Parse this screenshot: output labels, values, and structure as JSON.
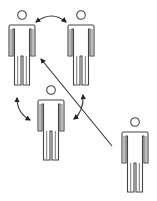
{
  "diagram": {
    "title": "",
    "colors": {
      "stroke": "#444444",
      "arrow": "#222222",
      "background": "#ffffff"
    },
    "figures": [
      {
        "id": "person-top-left",
        "cx": 22,
        "top": 10,
        "icon": "person-icon"
      },
      {
        "id": "person-top-right",
        "cx": 81,
        "top": 10,
        "icon": "person-icon"
      },
      {
        "id": "person-middle",
        "cx": 51,
        "top": 85,
        "icon": "person-icon"
      },
      {
        "id": "person-outsider",
        "cx": 135,
        "top": 117,
        "icon": "person-icon"
      }
    ],
    "arrows": [
      {
        "id": "arrow-top-pair",
        "type": "curved-double",
        "from": "person-top-left",
        "to": "person-top-right"
      },
      {
        "id": "arrow-left-pair",
        "type": "curved-double",
        "from": "person-top-left",
        "to": "person-middle"
      },
      {
        "id": "arrow-right-pair",
        "type": "curved-double",
        "from": "person-top-right",
        "to": "person-middle"
      },
      {
        "id": "arrow-outsider",
        "type": "straight-single",
        "from": "person-outsider",
        "to": "group-center"
      }
    ]
  }
}
